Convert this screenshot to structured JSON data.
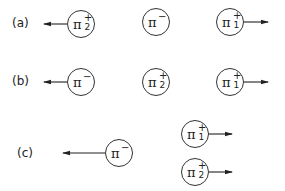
{
  "diagram": {
    "type": "pion momentum configurations",
    "rows": [
      {
        "label": "(a)",
        "particles": [
          {
            "name": "pi-plus-2",
            "symbol": "π",
            "charge": "+",
            "index": "2",
            "arrow": "left"
          },
          {
            "name": "pi-minus",
            "symbol": "π",
            "charge": "−",
            "index": "",
            "arrow": "none"
          },
          {
            "name": "pi-plus-1",
            "symbol": "π",
            "charge": "+",
            "index": "1",
            "arrow": "right"
          }
        ]
      },
      {
        "label": "(b)",
        "particles": [
          {
            "name": "pi-minus",
            "symbol": "π",
            "charge": "−",
            "index": "",
            "arrow": "left"
          },
          {
            "name": "pi-plus-2",
            "symbol": "π",
            "charge": "+",
            "index": "2",
            "arrow": "none"
          },
          {
            "name": "pi-plus-1",
            "symbol": "π",
            "charge": "+",
            "index": "1",
            "arrow": "right"
          }
        ]
      },
      {
        "label": "(c)",
        "particles": [
          {
            "name": "pi-minus",
            "symbol": "π",
            "charge": "−",
            "index": "",
            "arrow": "left-long"
          },
          {
            "name": "pi-plus-1",
            "symbol": "π",
            "charge": "+",
            "index": "1",
            "arrow": "right"
          },
          {
            "name": "pi-plus-2",
            "symbol": "π",
            "charge": "+",
            "index": "2",
            "arrow": "right"
          }
        ]
      }
    ]
  }
}
